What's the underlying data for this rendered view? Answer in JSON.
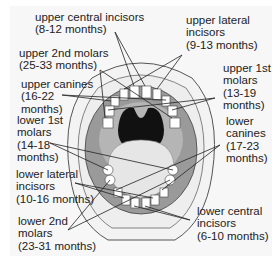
{
  "diagram": {
    "labels": [
      {
        "id": "upper-central-incisors",
        "text": "upper central incisors\n(8-12 months)"
      },
      {
        "id": "upper-lateral-incisors",
        "text": "upper lateral\nincisors\n(9-13 months)"
      },
      {
        "id": "upper-2nd-molars",
        "text": "upper 2nd molars\n(25-33 months)"
      },
      {
        "id": "upper-canines",
        "text": "upper canines\n(16-22\nmonths)"
      },
      {
        "id": "upper-1st-molars",
        "text": "upper 1st\nmolars\n(13-19\nmonths)"
      },
      {
        "id": "lower-1st-molars",
        "text": "lower 1st\nmolars\n(14-18\nmonths)"
      },
      {
        "id": "lower-canines",
        "text": "lower\ncanines\n(17-23\nmonths)"
      },
      {
        "id": "lower-lateral-incisors",
        "text": "lower lateral\nincisors\n(10-16 months)"
      },
      {
        "id": "lower-2nd-molars",
        "text": "lower 2nd\nmolars\n(23-31 months)"
      },
      {
        "id": "lower-central-incisors",
        "text": "lower central\nincisors\n(6-10 months)"
      }
    ],
    "colors": {
      "background": "#f7f7f7",
      "gum": "#9a9a9a",
      "palate": "#b5b5b5",
      "throat": "#111111",
      "tongue": "#e6e6e6",
      "tooth": "#ffffff",
      "line": "#222222"
    }
  }
}
